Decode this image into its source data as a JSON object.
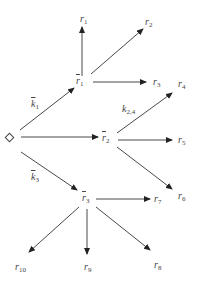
{
  "diagram": {
    "start_node": "◇",
    "nodes": {
      "rbar1": {
        "base": "r",
        "sub": "1",
        "overbar": true
      },
      "rbar2": {
        "base": "r",
        "sub": "2",
        "overbar": true
      },
      "rbar3": {
        "base": "r",
        "sub": "3",
        "overbar": true
      },
      "r1": {
        "base": "r",
        "sub": "1"
      },
      "r2": {
        "base": "r",
        "sub": "2"
      },
      "r3": {
        "base": "r",
        "sub": "3"
      },
      "r4": {
        "base": "r",
        "sub": "4"
      },
      "r5": {
        "base": "r",
        "sub": "5"
      },
      "r6": {
        "base": "r",
        "sub": "6"
      },
      "r7": {
        "base": "r",
        "sub": "7"
      },
      "r8": {
        "base": "r",
        "sub": "8"
      },
      "r9": {
        "base": "r",
        "sub": "9"
      },
      "r10": {
        "base": "r",
        "sub": "10"
      }
    },
    "edge_labels": {
      "k1": {
        "base": "k",
        "sub": "1",
        "overbar": true
      },
      "k3": {
        "base": "k",
        "sub": "3",
        "overbar": true
      },
      "k24": {
        "base": "k",
        "sub": "2,4",
        "overbar": false
      }
    },
    "edges": [
      [
        "start",
        "rbar1",
        "k1"
      ],
      [
        "start",
        "rbar2",
        ""
      ],
      [
        "start",
        "rbar3",
        "k3"
      ],
      [
        "rbar1",
        "r1",
        ""
      ],
      [
        "rbar1",
        "r2",
        ""
      ],
      [
        "rbar1",
        "r3",
        ""
      ],
      [
        "rbar2",
        "r4",
        "k24"
      ],
      [
        "rbar2",
        "r5",
        ""
      ],
      [
        "rbar2",
        "r6",
        ""
      ],
      [
        "rbar3",
        "r7",
        ""
      ],
      [
        "rbar3",
        "r8",
        ""
      ],
      [
        "rbar3",
        "r9",
        ""
      ],
      [
        "rbar3",
        "r10",
        ""
      ]
    ]
  }
}
